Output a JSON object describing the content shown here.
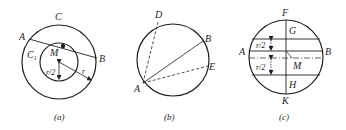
{
  "figure": {
    "panels": [
      {
        "id": "a",
        "caption": "(a)",
        "labels": {
          "C": "C",
          "A": "A",
          "B": "B",
          "C1_main": "C",
          "C1_sub": "1",
          "M": "M",
          "r_half": "r/2",
          "r": "r"
        }
      },
      {
        "id": "b",
        "caption": "(b)",
        "labels": {
          "D": "D",
          "B": "B",
          "E": "E",
          "A": "A"
        }
      },
      {
        "id": "c",
        "caption": "(c)",
        "labels": {
          "F": "F",
          "G": "G",
          "A": "A",
          "B": "B",
          "r_half_top": "r/2",
          "r_half_bottom": "r/2",
          "M": "M",
          "H": "H",
          "K": "K"
        }
      }
    ],
    "colors": {
      "ink": "#231f20",
      "background": "#ffffff"
    }
  }
}
